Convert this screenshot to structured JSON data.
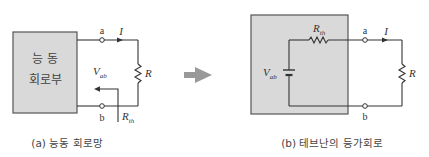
{
  "diagram_a": {
    "block_line1": "능 동",
    "block_line2": "회로부",
    "terminal_a": "a",
    "terminal_b": "b",
    "current": "I",
    "load": "R",
    "voltage": "V",
    "voltage_sub": "ab",
    "resistance": "R",
    "resistance_sub": "th",
    "caption": "(a) 능동 회로망"
  },
  "diagram_b": {
    "terminal_a": "a",
    "terminal_b": "b",
    "current": "I",
    "load": "R",
    "source": "V",
    "source_sub": "ab",
    "series_r": "R",
    "series_r_sub": "th",
    "caption": "(b) 테브난의 등가회로"
  },
  "colors": {
    "block_fill": "#d9d9d9",
    "block_stroke": "#555555",
    "wire": "#333333",
    "arrow": "#999999"
  }
}
